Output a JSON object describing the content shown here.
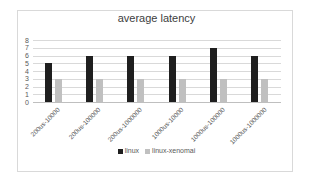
{
  "chart_data": {
    "type": "bar",
    "title": "average latency",
    "xlabel": "",
    "ylabel": "",
    "ylim": [
      0,
      8
    ],
    "yticks": [
      0,
      1,
      2,
      3,
      4,
      5,
      6,
      7,
      8
    ],
    "grid": true,
    "legend_position": "bottom",
    "categories": [
      "200us-10000",
      "200us-100000",
      "200us-1000000",
      "1000us-10000",
      "1000us-100000",
      "1000us-1000000"
    ],
    "series": [
      {
        "name": "linux",
        "color": "#1f1f1f",
        "values": [
          5,
          6,
          6,
          6,
          7,
          6
        ]
      },
      {
        "name": "linux-xenomai",
        "color": "#c0c0c0",
        "values": [
          3,
          3,
          3,
          3,
          3,
          3
        ]
      }
    ]
  }
}
